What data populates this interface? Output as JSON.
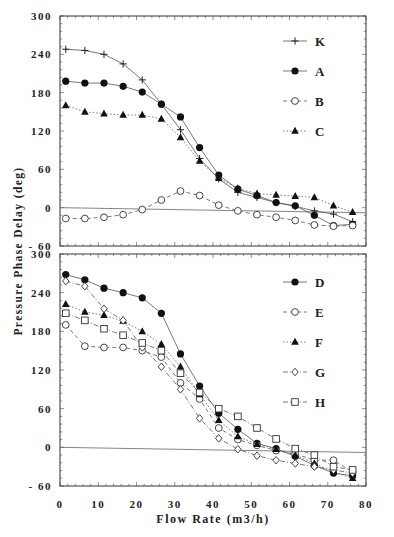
{
  "chart_data": [
    {
      "type": "line",
      "panel": "top",
      "title": "",
      "xlabel": "Flow Rate (m3/h)",
      "ylabel": "Pressure Phase Delay (deg)",
      "xlim": [
        0,
        80
      ],
      "ylim": [
        -60,
        300
      ],
      "yticks": [
        300,
        240,
        180,
        120,
        60,
        0,
        -60
      ],
      "xticks": [],
      "grid": false,
      "legend_position": "upper right inside",
      "reference_line": {
        "from": [
          0,
          0
        ],
        "to": [
          80,
          -8
        ]
      },
      "x": [
        1.5,
        6.5,
        11.5,
        16.5,
        21.5,
        26.5,
        31.5,
        36.5,
        41.5,
        46.5,
        51.5,
        56.5,
        61.5,
        66.5,
        71.5,
        76.5
      ],
      "series": [
        {
          "name": "K",
          "marker": "plus",
          "line": "solid",
          "values": [
            248,
            246,
            240,
            225,
            200,
            162,
            122,
            77,
            45,
            24,
            16,
            8,
            2,
            -5,
            -10,
            -22
          ]
        },
        {
          "name": "A",
          "marker": "filled-circle",
          "line": "solid",
          "values": [
            198,
            195,
            195,
            190,
            181,
            162,
            142,
            94,
            51,
            29,
            19,
            8,
            3,
            -12,
            -28,
            -26,
            -42
          ]
        },
        {
          "name": "B",
          "marker": "open-circle",
          "line": "dashed",
          "values": [
            -17,
            -17,
            -15,
            -11,
            -3,
            12,
            26,
            19,
            4,
            -5,
            -11,
            -15,
            -20,
            -27,
            -29,
            -28
          ]
        },
        {
          "name": "C",
          "marker": "filled-triangle",
          "line": "dotted",
          "values": [
            160,
            150,
            147,
            145,
            145,
            139,
            110,
            73,
            46,
            30,
            22,
            20,
            18,
            16,
            3,
            -7,
            -28
          ]
        }
      ]
    },
    {
      "type": "line",
      "panel": "bottom",
      "title": "",
      "xlabel": "Flow Rate (m3/h)",
      "ylabel": "Pressure Phase Delay (deg)",
      "xlim": [
        0,
        80
      ],
      "ylim": [
        -60,
        300
      ],
      "yticks": [
        300,
        240,
        180,
        120,
        60,
        0,
        -60
      ],
      "xticks": [
        0,
        10,
        20,
        30,
        40,
        50,
        60,
        70,
        80
      ],
      "grid": false,
      "legend_position": "upper right inside",
      "reference_line": {
        "from": [
          0,
          0
        ],
        "to": [
          80,
          -8
        ]
      },
      "x": [
        1.5,
        6.5,
        11.5,
        16.5,
        21.5,
        26.5,
        31.5,
        36.5,
        41.5,
        46.5,
        51.5,
        56.5,
        61.5,
        66.5,
        71.5,
        76.5
      ],
      "series": [
        {
          "name": "D",
          "marker": "filled-circle",
          "line": "solid",
          "values": [
            268,
            260,
            247,
            240,
            232,
            208,
            145,
            95,
            53,
            28,
            6,
            -2,
            -14,
            -28,
            -40,
            -44,
            -44
          ]
        },
        {
          "name": "E",
          "marker": "open-circle",
          "line": "dashed",
          "values": [
            190,
            157,
            155,
            155,
            150,
            140,
            100,
            75,
            30,
            12,
            3,
            -5,
            -10,
            -20,
            -20,
            -38
          ]
        },
        {
          "name": "F",
          "marker": "filled-triangle",
          "line": "dotted",
          "values": [
            222,
            210,
            205,
            196,
            180,
            160,
            125,
            82,
            42,
            17,
            5,
            -3,
            -12,
            -25,
            -38,
            -48
          ]
        },
        {
          "name": "G",
          "marker": "open-diamond",
          "line": "dash-dot",
          "values": [
            258,
            250,
            215,
            197,
            155,
            125,
            90,
            45,
            14,
            -3,
            -13,
            -20,
            -25,
            -30,
            -35,
            -40
          ]
        },
        {
          "name": "H",
          "marker": "open-square",
          "line": "dash-dot",
          "values": [
            208,
            197,
            184,
            174,
            162,
            150,
            115,
            85,
            60,
            48,
            30,
            13,
            -2,
            -12,
            -30,
            -35,
            -52
          ]
        }
      ]
    }
  ],
  "figure": {
    "ylabel": "Pressure Phase Delay (deg)",
    "xlabel": "Flow Rate (m3/h)",
    "legend_top": [
      "K",
      "A",
      "B",
      "C"
    ],
    "legend_bottom": [
      "D",
      "E",
      "F",
      "G",
      "H"
    ]
  }
}
